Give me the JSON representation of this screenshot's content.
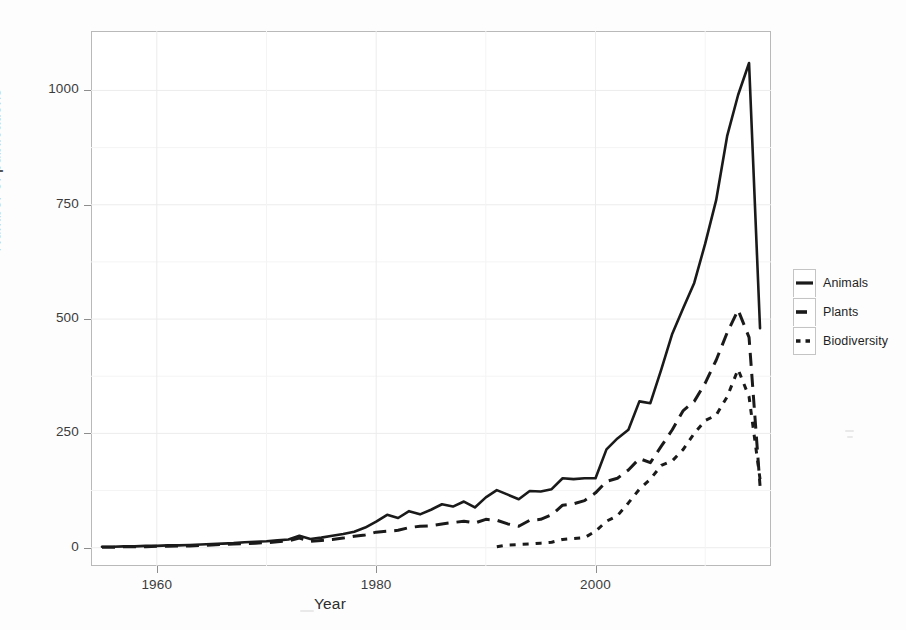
{
  "chart_data": {
    "type": "line",
    "title": "",
    "xlabel": "Year",
    "ylabel": "Number of publications",
    "xlim": [
      1954,
      2016
    ],
    "ylim": [
      -40,
      1130
    ],
    "xticks": [
      1960,
      1980,
      2000
    ],
    "xtick_labels": [
      "1960",
      "1980",
      "2000"
    ],
    "yticks": [
      0,
      250,
      500,
      750,
      1000
    ],
    "ytick_labels": [
      "0",
      "250",
      "500",
      "750",
      "1000"
    ],
    "minor_yticks": [
      125,
      375,
      625,
      875
    ],
    "minor_xticks": [
      1970,
      1990,
      2010
    ],
    "grid": true,
    "legend_position": "right",
    "line_color": "#1a1a1a",
    "series": [
      {
        "name": "Animals",
        "style": "solid",
        "x": [
          1955,
          1956,
          1957,
          1958,
          1959,
          1960,
          1961,
          1962,
          1963,
          1964,
          1965,
          1966,
          1967,
          1968,
          1969,
          1970,
          1971,
          1972,
          1973,
          1974,
          1975,
          1976,
          1977,
          1978,
          1979,
          1980,
          1981,
          1982,
          1983,
          1984,
          1985,
          1986,
          1987,
          1988,
          1989,
          1990,
          1991,
          1992,
          1993,
          1994,
          1995,
          1996,
          1997,
          1998,
          1999,
          2000,
          2001,
          2002,
          2003,
          2004,
          2005,
          2006,
          2007,
          2008,
          2009,
          2010,
          2011,
          2012,
          2013,
          2014,
          2015
        ],
        "values": [
          2,
          2,
          3,
          3,
          4,
          4,
          5,
          5,
          6,
          7,
          8,
          9,
          10,
          12,
          13,
          14,
          16,
          18,
          26,
          19,
          22,
          26,
          30,
          35,
          44,
          57,
          72,
          65,
          80,
          73,
          83,
          95,
          90,
          101,
          88,
          110,
          126,
          116,
          106,
          124,
          123,
          128,
          152,
          150,
          152,
          152,
          215,
          239,
          258,
          320,
          316,
          390,
          468,
          524,
          579,
          665,
          760,
          900,
          990,
          1060,
          480
        ]
      },
      {
        "name": "Plants",
        "style": "dashed",
        "x": [
          1955,
          1956,
          1957,
          1958,
          1959,
          1960,
          1961,
          1962,
          1963,
          1964,
          1965,
          1966,
          1967,
          1968,
          1969,
          1970,
          1971,
          1972,
          1973,
          1974,
          1975,
          1976,
          1977,
          1978,
          1979,
          1980,
          1981,
          1982,
          1983,
          1984,
          1985,
          1986,
          1987,
          1988,
          1989,
          1990,
          1991,
          1992,
          1993,
          1994,
          1995,
          1996,
          1997,
          1998,
          1999,
          2000,
          2001,
          2002,
          2003,
          2004,
          2005,
          2006,
          2007,
          2008,
          2009,
          2010,
          2011,
          2012,
          2013,
          2014,
          2015
        ],
        "values": [
          1,
          1,
          2,
          2,
          2,
          3,
          3,
          4,
          4,
          5,
          6,
          7,
          8,
          9,
          10,
          11,
          13,
          15,
          21,
          14,
          16,
          18,
          21,
          25,
          28,
          34,
          36,
          38,
          44,
          47,
          48,
          52,
          55,
          58,
          54,
          62,
          60,
          52,
          47,
          60,
          62,
          72,
          93,
          96,
          103,
          120,
          145,
          152,
          170,
          195,
          186,
          222,
          258,
          300,
          320,
          360,
          410,
          470,
          520,
          460,
          135
        ]
      },
      {
        "name": "Biodiversity",
        "style": "dotted",
        "x": [
          1991,
          1992,
          1993,
          1994,
          1995,
          1996,
          1997,
          1998,
          1999,
          2000,
          2001,
          2002,
          2003,
          2004,
          2005,
          2006,
          2007,
          2008,
          2009,
          2010,
          2011,
          2012,
          2013,
          2014,
          2015
        ],
        "values": [
          2,
          6,
          7,
          8,
          10,
          12,
          18,
          20,
          22,
          36,
          58,
          70,
          98,
          128,
          150,
          180,
          190,
          215,
          250,
          278,
          290,
          330,
          390,
          330,
          150
        ]
      }
    ]
  },
  "axis": {
    "y_title": "Number of publications",
    "x_title": "Year"
  },
  "legend": {
    "items": [
      {
        "label": "Animals",
        "style": "solid"
      },
      {
        "label": "Plants",
        "style": "dashed"
      },
      {
        "label": "Biodiversity",
        "style": "dotted"
      }
    ]
  }
}
